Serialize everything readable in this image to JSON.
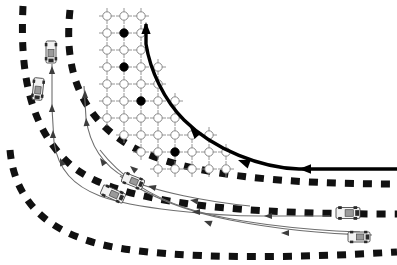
{
  "figure": {
    "title": "Curved multi-lane road scenario with discretized planning grid and vehicle trajectories",
    "canvas": {
      "width": 397,
      "height": 265,
      "background": "#ffffff"
    },
    "colors": {
      "lane_marking": "#111111",
      "grid_line": "#8a8a8a",
      "node_open": "#ffffff",
      "node_open_stroke": "#7d7d7d",
      "node_filled": "#000000",
      "planned_path": "#000000",
      "trajectory": "#6e6e6e",
      "vehicle_body": "#f2f2f2",
      "vehicle_stroke": "#4a4a4a",
      "vehicle_dark": "#2b2b2b"
    }
  },
  "lane_boundaries": {
    "label": "dashed-lane-markings",
    "stroke_width": 7,
    "dash_pattern": "9 9",
    "lines": [
      {
        "name": "lane-boundary-outer-left",
        "d": "M 23 6 C 20 70 28 128 72 166 C 120 206 250 214 397 214"
      },
      {
        "name": "lane-boundary-middle",
        "d": "M 70 10 C 64 66 78 112 124 142 C 176 176 286 184 397 184"
      },
      {
        "name": "lane-boundary-outer-bottom",
        "d": "M 10 150 C 14 196 42 232 108 246 C 176 260 300 258 397 252"
      }
    ]
  },
  "planning_grid": {
    "label": "discretized-state-lattice",
    "node_radius": 4.2,
    "cross_arm": 8,
    "spacing_x": 17,
    "spacing_y": 17,
    "origin": {
      "x": 107,
      "y": 16
    },
    "rows": [
      {
        "y": 16,
        "x_start": 107,
        "count": 3
      },
      {
        "y": 33,
        "x_start": 107,
        "count": 3
      },
      {
        "y": 50,
        "x_start": 107,
        "count": 3
      },
      {
        "y": 67,
        "x_start": 107,
        "count": 4
      },
      {
        "y": 84,
        "x_start": 107,
        "count": 4
      },
      {
        "y": 101,
        "x_start": 107,
        "count": 5
      },
      {
        "y": 118,
        "x_start": 107,
        "count": 5
      },
      {
        "y": 135,
        "x_start": 124,
        "count": 6
      },
      {
        "y": 152,
        "x_start": 141,
        "count": 6
      },
      {
        "y": 169,
        "x_start": 158,
        "count": 5
      }
    ],
    "filled_nodes": [
      {
        "x": 124,
        "y": 33,
        "name": "grid-node-filled-1"
      },
      {
        "x": 124,
        "y": 67,
        "name": "grid-node-filled-2"
      },
      {
        "x": 141,
        "y": 101,
        "name": "grid-node-filled-3"
      },
      {
        "x": 175,
        "y": 152,
        "name": "grid-node-filled-4"
      },
      {
        "x": 216,
        "y": 169,
        "name": "grid-node-filled-5"
      }
    ]
  },
  "planned_path": {
    "label": "ego-planned-path",
    "stroke_width": 3.4,
    "d": "M 397 169 L 299 169 C 262 168 214 150 184 120 C 164 100 150 70 146 44 L 146 24",
    "arrow_heads": [
      {
        "name": "path-arrow-head-top",
        "x": 146,
        "y": 22,
        "angle": -90
      },
      {
        "name": "path-arrow-head-mid",
        "x": 190,
        "y": 127,
        "angle": -132
      },
      {
        "name": "path-arrow-head-lower",
        "x": 238,
        "y": 160,
        "angle": -160
      },
      {
        "name": "path-arrow-head-right",
        "x": 299,
        "y": 169,
        "angle": 180
      }
    ]
  },
  "trajectories": {
    "label": "vehicle-predicted-trajectories",
    "stroke_width": 1.1,
    "paths": [
      {
        "name": "trajectory-lane1-vertical",
        "d": "M 52 64 L 52 108 L 54 142 C 58 170 74 186 100 196 C 132 208 210 216 262 216 L 330 216"
      },
      {
        "name": "trajectory-lane2-vertical",
        "d": "M 84 86 L 86 118 C 90 148 104 166 126 178 C 154 192 210 202 250 206"
      },
      {
        "name": "trajectory-lane3-lower",
        "d": "M 100 150 C 120 176 150 196 186 208 C 230 222 300 230 360 232"
      },
      {
        "name": "trajectory-lane4-bottom",
        "d": "M 120 176 C 150 198 190 212 230 220 C 280 230 330 234 372 235"
      }
    ],
    "arrow_heads": [
      {
        "name": "traj-arrow-1",
        "x": 52,
        "y": 66,
        "angle": -90
      },
      {
        "name": "traj-arrow-2",
        "x": 52,
        "y": 104,
        "angle": -90
      },
      {
        "name": "traj-arrow-3",
        "x": 53,
        "y": 130,
        "angle": -90
      },
      {
        "name": "traj-arrow-4",
        "x": 60,
        "y": 158,
        "angle": -112
      },
      {
        "name": "traj-arrow-5",
        "x": 85,
        "y": 90,
        "angle": -90
      },
      {
        "name": "traj-arrow-6",
        "x": 86,
        "y": 118,
        "angle": -95
      },
      {
        "name": "traj-arrow-7",
        "x": 100,
        "y": 158,
        "angle": -125
      },
      {
        "name": "traj-arrow-8",
        "x": 132,
        "y": 182,
        "angle": -152
      },
      {
        "name": "traj-arrow-9",
        "x": 190,
        "y": 200,
        "angle": -170
      },
      {
        "name": "traj-arrow-10",
        "x": 192,
        "y": 212,
        "angle": 180
      },
      {
        "name": "traj-arrow-11",
        "x": 264,
        "y": 216,
        "angle": 180
      },
      {
        "name": "traj-arrow-12",
        "x": 204,
        "y": 221,
        "angle": -160
      },
      {
        "name": "traj-arrow-13",
        "x": 281,
        "y": 233,
        "angle": 180
      },
      {
        "name": "traj-arrow-14",
        "x": 148,
        "y": 186,
        "angle": -165
      },
      {
        "name": "traj-arrow-15",
        "x": 130,
        "y": 166,
        "angle": -140
      }
    ]
  },
  "vehicles": [
    {
      "name": "vehicle-lane1-upper",
      "x": 51,
      "y": 52,
      "angle": 90,
      "length": 22,
      "width": 10
    },
    {
      "name": "vehicle-lane1-lower",
      "x": 38,
      "y": 89,
      "angle": 96,
      "length": 22,
      "width": 10
    },
    {
      "name": "vehicle-mid-left",
      "x": 113,
      "y": 194,
      "angle": 24,
      "length": 24,
      "width": 10
    },
    {
      "name": "vehicle-mid-right",
      "x": 133,
      "y": 181,
      "angle": 22,
      "length": 22,
      "width": 10
    },
    {
      "name": "vehicle-right-upper",
      "x": 348,
      "y": 213,
      "angle": 0,
      "length": 24,
      "width": 11
    },
    {
      "name": "vehicle-right-lower",
      "x": 359,
      "y": 237,
      "angle": 0,
      "length": 22,
      "width": 10
    }
  ],
  "legend_note": ""
}
